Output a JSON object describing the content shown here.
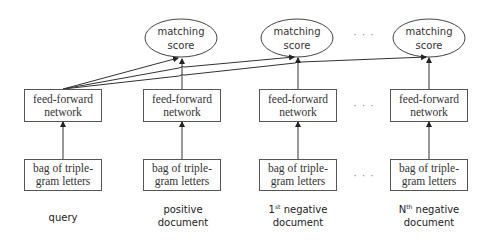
{
  "diagram": {
    "columns": [
      {
        "id": "query",
        "score": {
          "line1": "matching",
          "line2": "score",
          "visible": false
        },
        "ffn": {
          "line1": "feed-forward",
          "line2": "network"
        },
        "input": {
          "line1": "bag of triple-",
          "line2": "gram letters"
        },
        "caption": {
          "line1": "query",
          "line2": ""
        }
      },
      {
        "id": "positive",
        "score": {
          "line1": "matching",
          "line2": "score"
        },
        "ffn": {
          "line1": "feed-forward",
          "line2": "network"
        },
        "input": {
          "line1": "bag of triple-",
          "line2": "gram letters"
        },
        "caption": {
          "line1": "positive",
          "line2": "document"
        }
      },
      {
        "id": "negative-1",
        "score": {
          "line1": "matching",
          "line2": "score"
        },
        "ffn": {
          "line1": "feed-forward",
          "line2": "network"
        },
        "input": {
          "line1": "bag of triple-",
          "line2": "gram letters"
        },
        "caption": {
          "prefix": "1",
          "sup": "st",
          "line1_rest": " negative",
          "line2": "document"
        }
      },
      {
        "id": "negative-n",
        "score": {
          "line1": "matching",
          "line2": "score"
        },
        "ffn": {
          "line1": "feed-forward",
          "line2": "network"
        },
        "input": {
          "line1": "bag of triple-",
          "line2": "gram letters"
        },
        "caption": {
          "prefix": "N",
          "sup": "th",
          "line1_rest": " negative",
          "line2": "document"
        }
      }
    ],
    "ellipsis": "· · ·",
    "colors": {
      "stroke": "#555555",
      "text": "#333333",
      "background": "#ffffff"
    }
  }
}
